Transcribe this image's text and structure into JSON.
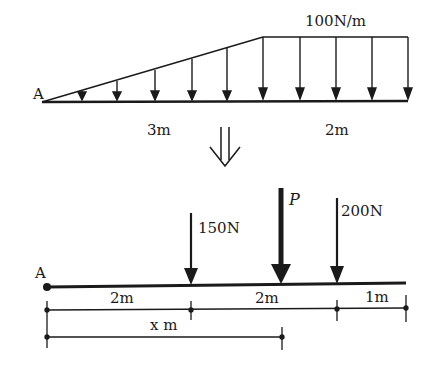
{
  "top_diagram": {
    "point_label": "A",
    "load_label": "100N/m",
    "segment_labels": [
      "3m",
      "2m"
    ]
  },
  "transform_arrow": "⇓",
  "bottom_diagram": {
    "point_label": "A",
    "forces": [
      {
        "label": "150N",
        "position_m": 2
      },
      {
        "label": "P",
        "position_m": 4
      },
      {
        "label": "200N",
        "position_m": 5
      }
    ],
    "dimension_labels": [
      "2m",
      "2m",
      "1m"
    ],
    "x_label": "x m"
  }
}
